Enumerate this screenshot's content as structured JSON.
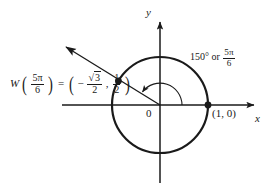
{
  "figure": {
    "background_color": "#ffffff",
    "ink_color": "#1a1a1a",
    "width": 276,
    "height": 190
  },
  "axes": {
    "x_label": "x",
    "y_label": "y",
    "origin_label": "0",
    "x_axis": {
      "x1": 62,
      "y1": 105,
      "x2": 262,
      "y2": 105
    },
    "y_axis": {
      "x1": 160,
      "y1": 14,
      "x2": 160,
      "y2": 183
    }
  },
  "circle": {
    "center_x": 160,
    "center_y": 105,
    "radius": 48,
    "stroke_width": 2.2
  },
  "angle": {
    "degrees_label": "150°",
    "or_label": "or",
    "radians_numerator": "5π",
    "radians_denominator": "6",
    "value_degrees": 150,
    "arc_radius": 22
  },
  "terminal_ray": {
    "from_x": 160,
    "from_y": 105,
    "tip_x": 57,
    "tip_y": 42,
    "angle_degrees": 150
  },
  "points": [
    {
      "name": "point-on-circle-5pi-6",
      "x": 118.4,
      "y": 81,
      "label": "",
      "coordinates": [
        -0.866,
        0.5
      ]
    },
    {
      "name": "point-one-zero",
      "x": 208,
      "y": 105,
      "label": "(1, 0)",
      "coordinates": [
        1,
        0
      ]
    }
  ],
  "equation": {
    "function_name": "W",
    "argument_numerator": "5π",
    "argument_denominator": "6",
    "equals": "=",
    "x_coordinate_sign": "−",
    "x_coordinate_radicand": "3",
    "x_coordinate_denominator": "2",
    "comma": ",",
    "y_coordinate_numerator": "1",
    "y_coordinate_denominator": "2",
    "plain_text": "W(5π/6) = (−√3/2, 1/2)"
  }
}
